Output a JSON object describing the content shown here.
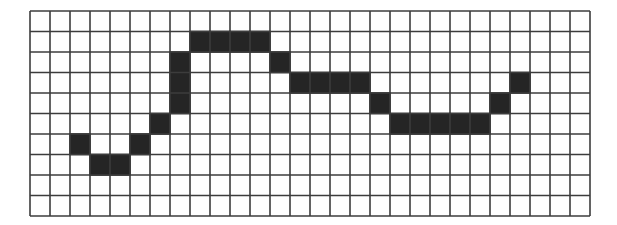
{
  "grid": {
    "columns": 28,
    "rows": 10,
    "origin_x": 30,
    "origin_y": 11,
    "cell_width": 20,
    "cell_height": 20.5,
    "line_color": "#3c3c3c",
    "fill_color": "#252525",
    "background_color": "#ffffff"
  },
  "filled_cells": [
    {
      "row": 6,
      "col": 2
    },
    {
      "row": 7,
      "col": 3
    },
    {
      "row": 7,
      "col": 4
    },
    {
      "row": 6,
      "col": 5
    },
    {
      "row": 5,
      "col": 6
    },
    {
      "row": 2,
      "col": 7
    },
    {
      "row": 3,
      "col": 7
    },
    {
      "row": 4,
      "col": 7
    },
    {
      "row": 1,
      "col": 8
    },
    {
      "row": 1,
      "col": 9
    },
    {
      "row": 1,
      "col": 10
    },
    {
      "row": 1,
      "col": 11
    },
    {
      "row": 2,
      "col": 12
    },
    {
      "row": 3,
      "col": 13
    },
    {
      "row": 3,
      "col": 14
    },
    {
      "row": 3,
      "col": 15
    },
    {
      "row": 3,
      "col": 16
    },
    {
      "row": 4,
      "col": 17
    },
    {
      "row": 5,
      "col": 18
    },
    {
      "row": 5,
      "col": 19
    },
    {
      "row": 5,
      "col": 20
    },
    {
      "row": 5,
      "col": 21
    },
    {
      "row": 5,
      "col": 22
    },
    {
      "row": 4,
      "col": 23
    },
    {
      "row": 3,
      "col": 24
    }
  ]
}
